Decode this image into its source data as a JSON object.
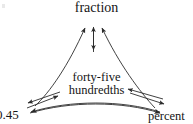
{
  "diagram": {
    "type": "concept-map",
    "background_color": "#ffffff",
    "stroke_color": "#2b2b2b",
    "text_color": "#151515",
    "nodes": [
      {
        "id": "fraction",
        "label": "fraction",
        "position": "top-center"
      },
      {
        "id": "center",
        "label_line1": "forty-five",
        "label_line2": "hundredths",
        "position": "center"
      },
      {
        "id": "decimal",
        "label": "0.45",
        "position": "bottom-left",
        "clipped": true
      },
      {
        "id": "percent",
        "label": "percent",
        "position": "bottom-right",
        "clipped": true
      }
    ],
    "connections": [
      {
        "from": "center",
        "to": "fraction",
        "style": "double-headed-arrow"
      },
      {
        "from": "decimal",
        "to": "fraction",
        "style": "curved-arrow"
      },
      {
        "from": "percent",
        "to": "fraction",
        "style": "curved-arrow"
      },
      {
        "from": "decimal",
        "to": "center",
        "style": "double-headed-arrow"
      },
      {
        "from": "percent",
        "to": "center",
        "style": "double-headed-arrow"
      },
      {
        "from": "decimal",
        "to": "percent",
        "style": "double-headed-curved-arc"
      }
    ]
  }
}
